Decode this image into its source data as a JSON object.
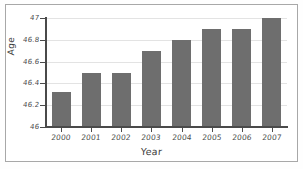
{
  "chart_data": {
    "type": "bar",
    "title": "",
    "xlabel": "Year",
    "ylabel": "Age",
    "categories": [
      "2000",
      "2001",
      "2002",
      "2003",
      "2004",
      "2005",
      "2006",
      "2007"
    ],
    "values": [
      46.32,
      46.5,
      46.5,
      46.7,
      46.8,
      46.9,
      46.9,
      47.0
    ],
    "ylim": [
      46,
      47
    ],
    "yticks": [
      "46",
      "46.2",
      "46.4",
      "46.6",
      "46.8",
      "47"
    ],
    "ytick_values": [
      46,
      46.2,
      46.4,
      46.6,
      46.8,
      47
    ],
    "grid": true,
    "legend": "none",
    "series": [
      {
        "name": "Age",
        "values": [
          46.32,
          46.5,
          46.5,
          46.7,
          46.8,
          46.9,
          46.9,
          47.0
        ]
      }
    ],
    "bar_color": "#6e6e6e",
    "plot_background": "#ffffff",
    "gridline_color": "#e3e3e3",
    "axis_color": "#4a4a4a",
    "frame_color": "#a8a8a8"
  }
}
